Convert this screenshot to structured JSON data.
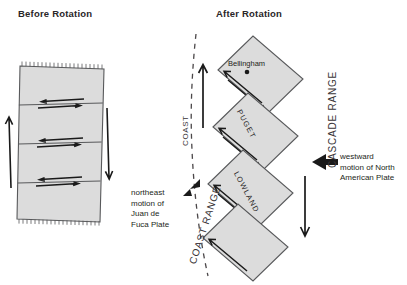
{
  "figure": {
    "kind": "geology-block-rotation-diagram",
    "panels": [
      {
        "title": "Before Rotation"
      },
      {
        "title": "After Rotation"
      }
    ]
  },
  "panel_before": {
    "title": "Before Rotation",
    "description": "Single vertical fault block divided by three strike-slip faults with paired opposing arrows; hachured top and bottom edges; up arrow on left flank, down arrow on right flank.",
    "fault_count": 3,
    "side_arrows": [
      {
        "name": "left-flank-up-arrow",
        "direction": "up"
      },
      {
        "name": "right-flank-down-arrow",
        "direction": "down"
      }
    ]
  },
  "panel_after": {
    "title": "After Rotation",
    "description": "Four en-echelon rotated blocks forming a zigzag, each with paired opposing strike-slip arrows.",
    "city": {
      "name": "Bellingham"
    },
    "blocks": [
      {
        "label": ""
      },
      {
        "label": "PUGET"
      },
      {
        "label": "LOWLAND"
      },
      {
        "label": ""
      }
    ],
    "region_labels": {
      "coast": "COAST",
      "coast_range": "COAST RANGE",
      "cascade_range": "CASCADE RANGE"
    },
    "annotations": {
      "juan_de_fuca": "northeast\nmotion of\nJuan de\nFuca Plate",
      "north_american": "westward\nmotion of North\nAmerican Plate"
    },
    "arrows": [
      {
        "name": "juan-de-fuca-arrow",
        "direction": "northeast"
      },
      {
        "name": "north-american-plate-arrow",
        "direction": "west"
      },
      {
        "name": "coast-uplift-arrow",
        "direction": "up"
      },
      {
        "name": "east-side-down-arrow",
        "direction": "down"
      }
    ]
  },
  "colors": {
    "block_fill": "#dcdcdc",
    "block_stroke": "#58595b",
    "text": "#231f20",
    "label_gray": "#3a3537",
    "arrow": "#1a1a1a",
    "background": "#ffffff"
  }
}
